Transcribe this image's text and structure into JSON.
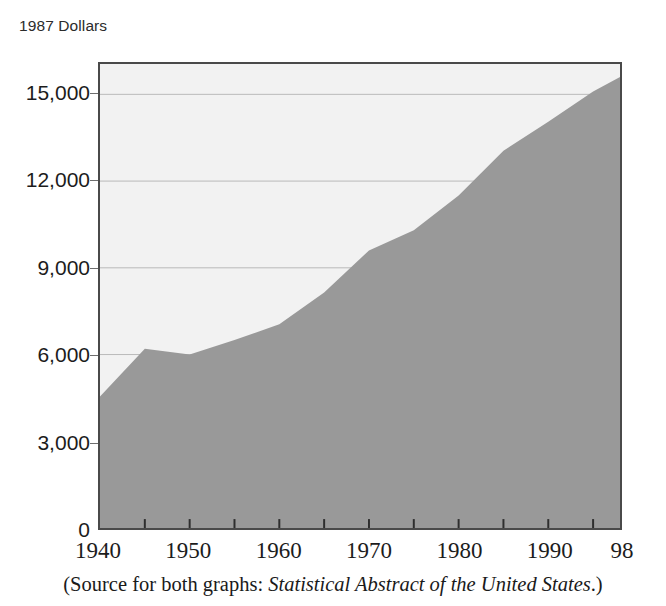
{
  "figure": {
    "axis_title": "1987 Dollars",
    "source_caption": {
      "prefix": "(Source for both graphs: ",
      "italic_title": "Statistical Abstract of the United States",
      "suffix": ".)"
    }
  },
  "colors": {
    "area_fill": "#999999",
    "plot_background": "#f2f2f2",
    "frame": "#4a4a4a",
    "gridline": "#b9b9b9",
    "text": "#1c1c1c"
  },
  "chart_data": {
    "type": "area",
    "title": "1987 Dollars",
    "xlabel": "",
    "ylabel": "1987 Dollars",
    "xlim": [
      1940,
      1998
    ],
    "ylim": [
      0,
      16050
    ],
    "grid": true,
    "legend": null,
    "yticks": [
      0,
      3000,
      6000,
      9000,
      12000,
      15000
    ],
    "ytick_labels": [
      "0",
      "3,000",
      "6,000",
      "9,000",
      "12,000",
      "15,000"
    ],
    "xticks": [
      1940,
      1945,
      1950,
      1955,
      1960,
      1965,
      1970,
      1975,
      1980,
      1985,
      1990,
      1995,
      1998
    ],
    "xtick_labels": [
      "1940",
      "",
      "1950",
      "",
      "1960",
      "",
      "1970",
      "",
      "1980",
      "",
      "1990",
      "",
      "98"
    ],
    "x": [
      1940,
      1945,
      1950,
      1955,
      1960,
      1965,
      1970,
      1975,
      1980,
      1985,
      1990,
      1995,
      1998
    ],
    "values": [
      4550,
      6200,
      6000,
      6500,
      7050,
      8150,
      9600,
      10300,
      11500,
      13050,
      14050,
      15100,
      15600
    ],
    "series": [
      {
        "name": "Per capita income (1987 dollars)",
        "values": [
          4550,
          6200,
          6000,
          6500,
          7050,
          8150,
          9600,
          10300,
          11500,
          13050,
          14050,
          15100,
          15600
        ]
      }
    ]
  }
}
